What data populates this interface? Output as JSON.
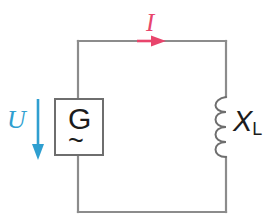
{
  "figure": {
    "background": "#ffffff"
  },
  "colors": {
    "wire": "#8c8c8c",
    "component_outline": "#6e6e6e",
    "current_accent": "#e8456c",
    "voltage_accent": "#2f9fd0",
    "text": "#1c1c1c"
  },
  "labels": {
    "current": "I",
    "voltage": "U",
    "reactance_symbol": "X",
    "reactance_subscript": "L",
    "generator": "G",
    "generator_ac": "~"
  },
  "components": [
    {
      "name": "generator",
      "type": "ac-source",
      "symbol": "G",
      "secondary_symbol": "~",
      "position": {
        "x": 55,
        "y": 99,
        "width": 48,
        "height": 56
      }
    },
    {
      "name": "inductor",
      "type": "inductive-reactance",
      "symbol": "X",
      "subscript": "L",
      "position": {
        "x": 214,
        "y": 97,
        "width": 12,
        "height": 60
      }
    }
  ],
  "annotations": [
    {
      "name": "current-arrow",
      "label": "I",
      "color": "#e8456c",
      "direction": "right",
      "on": "top-wire"
    },
    {
      "name": "voltage-arrow",
      "label": "U",
      "color": "#2f9fd0",
      "direction": "down",
      "on": "left-branch"
    }
  ],
  "circuit_loop": {
    "left": 78,
    "right": 226,
    "top": 41,
    "bottom": 212
  }
}
